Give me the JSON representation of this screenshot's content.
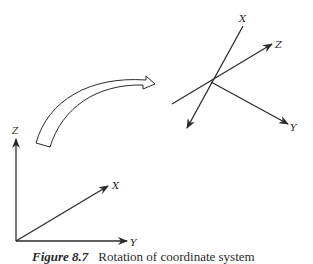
{
  "figure": {
    "caption_number": "Figure 8.7",
    "caption_text": "Rotation of coordinate system",
    "colors": {
      "stroke": "#2a2a2a",
      "background": "#ffffff"
    },
    "original_axes": {
      "labels": {
        "z": "Z",
        "x": "X",
        "y": "Y"
      }
    },
    "rotated_axes": {
      "labels": {
        "x": "X",
        "z": "Z",
        "y": "Y"
      }
    },
    "transform_arrow": {
      "description": "curved hollow arrow indicating rotation"
    }
  }
}
